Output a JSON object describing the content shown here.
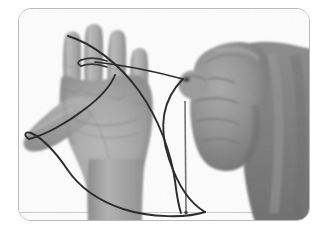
{
  "image": {
    "kind": "photograph",
    "color_mode": "grayscale",
    "caption": "Two hands holding a loop of string: the left hand is open with fingers spread and string hooked over the index and middle fingers, while the right hand is clenched in a fist gripping the other end of the string.",
    "frame": {
      "shape": "rounded-rectangle",
      "border_color": "#b9babc",
      "corner_radius_px": 13,
      "background_color": "#fdfdfd"
    },
    "palette": {
      "page_background": "#ffffff",
      "photo_background": "#fdfdfd",
      "left_hand_midtone": "#a9a9a9",
      "left_hand_highlight": "#c3c3c3",
      "left_hand_shadow": "#8d8d8d",
      "right_hand_midtone": "#8f8f8f",
      "right_hand_highlight": "#a6a6a6",
      "right_hand_shadow": "#6d6d6d",
      "forearm_tone": "#7f7f7f",
      "string_color": "#2b2b2b",
      "ground_line": "#c8c8c8"
    },
    "objects": [
      {
        "name": "left-hand",
        "label": "Open left hand, palm toward viewer, four fingers spread and thumb extended to the lower left",
        "tone": "#a9a9a9"
      },
      {
        "name": "right-hand",
        "label": "Clenched right fist gripping the string between thumb and index finger",
        "tone": "#8f8f8f"
      },
      {
        "name": "right-forearm",
        "label": "Right forearm entering the frame from the right edge",
        "tone": "#7f7f7f"
      },
      {
        "name": "string-loop",
        "label": "Large closed loop of dark string running from the left hand fingertips, across the palm and thumb, down to the bottom of the frame and up to the fist",
        "tone": "#2b2b2b"
      },
      {
        "name": "string-tail",
        "label": "Straight vertical length of string hanging from the fist to the bottom of the frame",
        "tone": "#6a6a6a"
      },
      {
        "name": "finger-wrap",
        "label": "Short loop of string wrapped twice around the left middle finger",
        "tone": "#3a3a3a"
      }
    ]
  }
}
